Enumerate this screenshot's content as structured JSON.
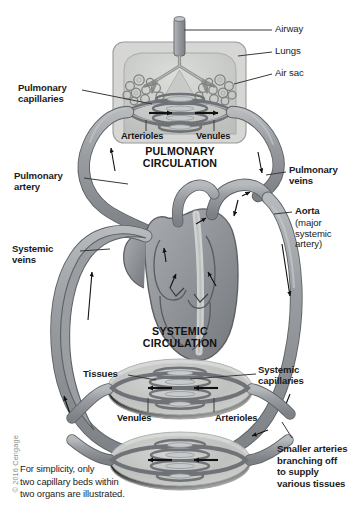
{
  "figure": {
    "copyright": "© 2016 Cengage"
  },
  "section_titles": {
    "pulmonary": "PULMONARY\nCIRCULATION",
    "systemic": "SYSTEMIC\nCIRCULATION"
  },
  "labels_right": [
    {
      "key": "airway",
      "text": "Airway",
      "weight": "regular"
    },
    {
      "key": "lungs",
      "text": "Lungs",
      "weight": "regular"
    },
    {
      "key": "air_sac",
      "text": "Air sac",
      "weight": "regular"
    },
    {
      "key": "pulmonary_veins",
      "text": "Pulmonary\nveins",
      "weight": "bold"
    },
    {
      "key": "aorta",
      "text": "Aorta",
      "weight": "bold"
    },
    {
      "key": "aorta_sub",
      "text": "(major\nsystemic\nartery)",
      "weight": "regular"
    },
    {
      "key": "systemic_capillaries",
      "text": "Systemic\ncapillaries",
      "weight": "bold"
    },
    {
      "key": "smaller_arteries",
      "text": "Smaller arteries\nbranching off\nto supply\nvarious tissues",
      "weight": "bold"
    }
  ],
  "labels_left": [
    {
      "key": "pulmonary_capillaries",
      "text": "Pulmonary\ncapillaries",
      "weight": "bold"
    },
    {
      "key": "pulmonary_artery",
      "text": "Pulmonary\nartery",
      "weight": "bold"
    },
    {
      "key": "systemic_veins",
      "text": "Systemic\nveins",
      "weight": "bold"
    },
    {
      "key": "tissues",
      "text": "Tissues",
      "weight": "bold"
    }
  ],
  "labels_inner": [
    {
      "key": "pulm_arterioles",
      "text": "Arterioles"
    },
    {
      "key": "pulm_venules",
      "text": "Venules"
    },
    {
      "key": "sys_venules",
      "text": "Venules"
    },
    {
      "key": "sys_arterioles",
      "text": "Arterioles"
    }
  ],
  "note": "For simplicity, only\ntwo capillary beds within\ntwo organs are illustrated.",
  "colors": {
    "vessel_fill": "#8f9296",
    "vessel_fill_light": "#b9bcc0",
    "vessel_stroke": "#5d6064",
    "lung_box_fill": "#d6d7d4",
    "lung_box_stroke": "#9a9b98",
    "lung_fill": "#c3c5c2",
    "tissue_fill": "#c9cbc9",
    "tissue_stroke": "#9ea09e",
    "heart_light": "#d8dad7",
    "text": "#1b1b1b",
    "leader": "#3a3a3a",
    "copyright": "#8d8d8d",
    "background": "#ffffff"
  }
}
